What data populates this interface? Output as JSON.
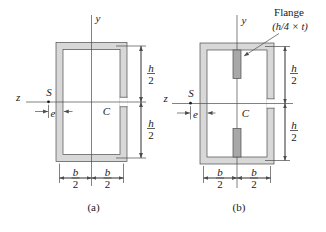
{
  "colors": {
    "background": "#ffffff",
    "wall_fill": "#d8d8d8",
    "flange_fill": "#a8a8a8",
    "line": "#4c4c4c",
    "text": "#1a1a1a"
  },
  "labels": {
    "y_axis": "y",
    "z_axis": "z",
    "shear_center": "S",
    "centroid": "C",
    "eccentricity": "e",
    "h_numerator": "h",
    "b_numerator": "b",
    "denominator": "2",
    "flange_title": "Flange",
    "flange_size": "(h/4 × t)",
    "caption_a": "(a)",
    "caption_b": "(b)"
  }
}
